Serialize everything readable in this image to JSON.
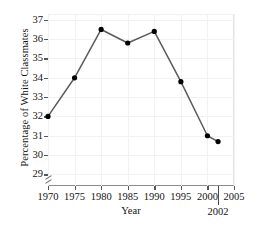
{
  "chart_data": {
    "type": "line",
    "title": "",
    "xlabel": "Year",
    "ylabel": "Percentage of White Classmates",
    "x": [
      1970,
      1975,
      1980,
      1985,
      1990,
      1995,
      2000,
      2002
    ],
    "values": [
      32.0,
      34.0,
      36.5,
      35.8,
      36.4,
      33.8,
      31.0,
      30.7
    ],
    "series": [
      {
        "name": "Percentage of White Classmates",
        "values": [
          32.0,
          34.0,
          36.5,
          35.8,
          36.4,
          33.8,
          31.0,
          30.7
        ]
      }
    ],
    "xlim": [
      1970,
      2005
    ],
    "ylim": [
      28.4,
      37.3
    ],
    "xticks": [
      1970,
      1975,
      1980,
      1985,
      1990,
      1995,
      2000,
      2005
    ],
    "xtick_labels": [
      "1970",
      "1975",
      "1980",
      "1985",
      "1990",
      "1995",
      "2000",
      "2005"
    ],
    "yticks": [
      29,
      30,
      31,
      32,
      33,
      34,
      35,
      36,
      37
    ],
    "ytick_labels": [
      "29",
      "30",
      "31",
      "32",
      "33",
      "34",
      "35",
      "36",
      "37"
    ],
    "grid": true,
    "legend": "none",
    "marker": "filled-circle",
    "line_color": "#5b5b5b",
    "marker_color": "#000000",
    "grid_color": "#f2f2f2",
    "axis_color": "#555555",
    "annotations": [
      {
        "name": "year-2002-callout",
        "label": "2002",
        "x": 2002,
        "type": "axis-tick-callout"
      }
    ],
    "axis_break": {
      "axis": "y",
      "present": true,
      "position": "below-lowest-tick"
    }
  }
}
